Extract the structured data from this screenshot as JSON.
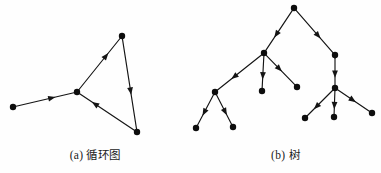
{
  "figure": {
    "background_color": "#fefefe",
    "ink_color": "#141414",
    "node_color": "#0d0d0d"
  },
  "panels": [
    {
      "id": "cyclic-graph",
      "caption": "(a) 循环图",
      "caption_label": "(a)",
      "caption_text": "循环图",
      "graph_type": "directed-cyclic-graph",
      "node_radius": 3.2,
      "nodes": [
        {
          "id": "n1",
          "x": 13,
          "y": 107,
          "name": "node-left-end"
        },
        {
          "id": "n2",
          "x": 77,
          "y": 92,
          "name": "node-hub"
        },
        {
          "id": "n3",
          "x": 122,
          "y": 36,
          "name": "node-top"
        },
        {
          "id": "n4",
          "x": 137,
          "y": 132,
          "name": "node-bottom-right"
        }
      ],
      "edges": [
        {
          "from": "n1",
          "to": "n2",
          "arrow_at": 0.62,
          "name": "edge-left-to-hub"
        },
        {
          "from": "n2",
          "to": "n3",
          "arrow_at": 0.66,
          "name": "edge-hub-to-top"
        },
        {
          "from": "n3",
          "to": "n4",
          "arrow_at": 0.58,
          "name": "edge-top-to-bottomright"
        },
        {
          "from": "n4",
          "to": "n2",
          "arrow_at": 0.72,
          "name": "edge-bottomright-to-hub"
        }
      ]
    },
    {
      "id": "tree-graph",
      "caption": "(b) 树",
      "caption_label": "(b)",
      "caption_text": "树",
      "graph_type": "directed-rooted-tree",
      "node_radius": 3.2,
      "nodes": [
        {
          "id": "t-root",
          "x": 294,
          "y": 8,
          "name": "node-root"
        },
        {
          "id": "t-l",
          "x": 264,
          "y": 53,
          "name": "node-left-branch"
        },
        {
          "id": "t-r",
          "x": 335,
          "y": 55,
          "name": "node-right-branch"
        },
        {
          "id": "t-l1",
          "x": 215,
          "y": 92,
          "name": "node-left-subbranch"
        },
        {
          "id": "t-l2",
          "x": 262,
          "y": 91,
          "name": "node-left-mid-leaf"
        },
        {
          "id": "t-l3",
          "x": 297,
          "y": 87,
          "name": "node-left-right-leaf"
        },
        {
          "id": "t-l1a",
          "x": 196,
          "y": 128,
          "name": "node-leftmost-leaf"
        },
        {
          "id": "t-l1b",
          "x": 233,
          "y": 127,
          "name": "node-left-inner-leaf"
        },
        {
          "id": "t-r1",
          "x": 335,
          "y": 88,
          "name": "node-right-subbranch"
        },
        {
          "id": "t-r1a",
          "x": 305,
          "y": 118,
          "name": "node-right-left-leaf"
        },
        {
          "id": "t-r1b",
          "x": 334,
          "y": 117,
          "name": "node-right-mid-leaf"
        },
        {
          "id": "t-r1c",
          "x": 372,
          "y": 113,
          "name": "node-rightmost-leaf"
        }
      ],
      "edges": [
        {
          "from": "t-root",
          "to": "t-l",
          "arrow_at": 0.6,
          "name": "edge-root-to-left"
        },
        {
          "from": "t-root",
          "to": "t-r",
          "arrow_at": 0.6,
          "name": "edge-root-to-right"
        },
        {
          "from": "t-l",
          "to": "t-l1",
          "arrow_at": 0.62,
          "name": "edge-left-to-subbranch"
        },
        {
          "from": "t-l",
          "to": "t-l2",
          "arrow_at": 0.62,
          "name": "edge-left-to-midleaf"
        },
        {
          "from": "t-l",
          "to": "t-l3",
          "arrow_at": 0.46,
          "name": "edge-left-to-rightleaf"
        },
        {
          "from": "t-l1",
          "to": "t-l1a",
          "arrow_at": 0.58,
          "name": "edge-subbranch-to-leftleaf"
        },
        {
          "from": "t-l1",
          "to": "t-l1b",
          "arrow_at": 0.58,
          "name": "edge-subbranch-to-innerleaf"
        },
        {
          "from": "t-r",
          "to": "t-r1",
          "arrow_at": 0.6,
          "name": "edge-right-to-subbranch"
        },
        {
          "from": "t-r1",
          "to": "t-r1a",
          "arrow_at": 0.64,
          "name": "edge-rightsub-to-leftleaf"
        },
        {
          "from": "t-r1",
          "to": "t-r1b",
          "arrow_at": 0.64,
          "name": "edge-rightsub-to-midleaf"
        },
        {
          "from": "t-r1",
          "to": "t-r1c",
          "arrow_at": 0.48,
          "name": "edge-rightsub-to-rightleaf"
        }
      ]
    }
  ]
}
